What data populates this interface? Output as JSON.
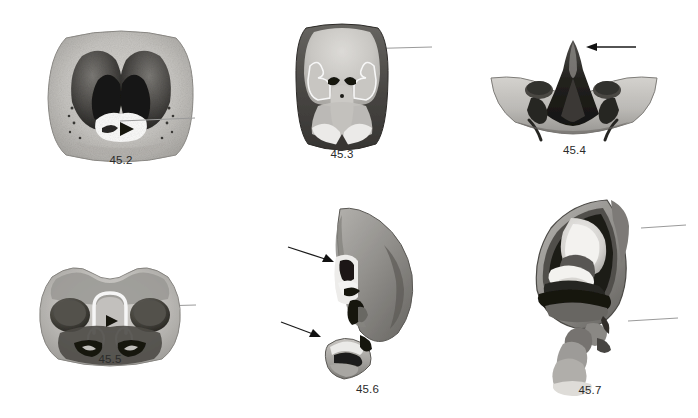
{
  "figure": {
    "plate_label": "45",
    "background_color": "#ffffff",
    "ink_color": "#2b2b2b",
    "style": "grayscale stippled scientific illustration",
    "rows": 2,
    "columns": 3
  },
  "panels": [
    {
      "id": "45-2",
      "label": "45.2",
      "shape": "rounded-square cross-section with paired dark lobes and white median cavity",
      "x": 36,
      "y": 22,
      "width": 170,
      "height": 148,
      "label_x": 0,
      "label_y": 132,
      "pointers": [
        {
          "type": "leader-line-with-arrowhead",
          "name": "pointer-45-2-median-cavity",
          "x1": 195,
          "y1": 118,
          "x2": 113,
          "y2": 122,
          "arrow": "left",
          "color": "#9a9a9a"
        }
      ]
    },
    {
      "id": "45-3",
      "label": "45.3",
      "shape": "rounded-square plate with pale median body and dark marginal band",
      "x": 288,
      "y": 18,
      "width": 108,
      "height": 130,
      "label_x": 0,
      "label_y": 130,
      "pointers": [
        {
          "type": "leader-line-with-arrowhead",
          "name": "pointer-45-3-median-lobe",
          "x1": 432,
          "y1": 47,
          "x2": 348,
          "y2": 49,
          "arrow": "left",
          "color": "#9a9a9a"
        }
      ]
    },
    {
      "id": "45-4",
      "label": "45.4",
      "shape": "wide crescent boat-shaped sclerite with dark median spike",
      "x": 487,
      "y": 30,
      "width": 175,
      "height": 106,
      "label_x": 0,
      "label_y": 114,
      "pointers": [
        {
          "type": "arrow",
          "name": "pointer-45-4-apical-spike",
          "x1": 636,
          "y1": 47,
          "x2": 586,
          "y2": 47,
          "arrow": "left",
          "color": "#1a1a1a"
        }
      ]
    },
    {
      "id": "45-5",
      "label": "45.5",
      "shape": "broad rounded sclerite with two dark circular fossae and white median arch",
      "x": 30,
      "y": 255,
      "width": 160,
      "height": 110,
      "label_x": 0,
      "label_y": 98,
      "pointers": [
        {
          "type": "leader-line-with-arrowhead",
          "name": "pointer-45-5-median-arch",
          "x1": 196,
          "y1": 305,
          "x2": 113,
          "y2": 307,
          "arrow": "left",
          "color": "#9a9a9a"
        }
      ]
    },
    {
      "id": "45-6",
      "label": "45.6",
      "shape": "lateral teardrop comma-shaped lobe with detached basal piece",
      "x": 300,
      "y": 205,
      "width": 135,
      "height": 175,
      "label_x": 0,
      "label_y": 178,
      "pointers": [
        {
          "type": "arrow",
          "name": "pointer-45-6-upper-notch",
          "x1": 288,
          "y1": 247,
          "x2": 333,
          "y2": 262,
          "arrow": "down-right",
          "color": "#1a1a1a"
        },
        {
          "type": "arrow",
          "name": "pointer-45-6-basal-piece",
          "x1": 281,
          "y1": 322,
          "x2": 320,
          "y2": 337,
          "arrow": "down-right",
          "color": "#1a1a1a"
        }
      ]
    },
    {
      "id": "45-7",
      "label": "45.7",
      "shape": "lateral teardrop with nested internal sclerites and coiled basal process",
      "x": 515,
      "y": 198,
      "width": 150,
      "height": 185,
      "label_x": 0,
      "label_y": 186,
      "pointers": [
        {
          "type": "leader-line-with-arrowhead",
          "name": "pointer-45-7-upper-sclerite",
          "x1": 686,
          "y1": 225,
          "x2": 640,
          "y2": 228,
          "arrow": "left",
          "color": "#9a9a9a"
        },
        {
          "type": "leader-line-with-arrowhead",
          "name": "pointer-45-7-basal-process",
          "x1": 678,
          "y1": 318,
          "x2": 626,
          "y2": 321,
          "arrow": "left",
          "color": "#9a9a9a"
        }
      ]
    }
  ]
}
